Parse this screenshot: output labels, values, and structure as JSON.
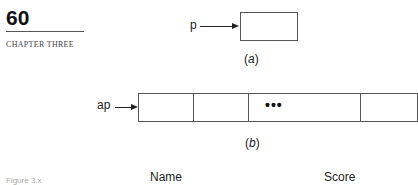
{
  "header": {
    "page_number": "60",
    "chapter": "CHAPTER THREE"
  },
  "figure_a": {
    "pointer_label": "p",
    "caption_open": "(",
    "caption_letter": "a",
    "caption_close": ")"
  },
  "figure_b": {
    "pointer_label": "ap",
    "ellipsis": "•••",
    "caption_open": "(",
    "caption_letter": "b",
    "caption_close": ")"
  },
  "table_header": {
    "col1": "Name",
    "col2": "Score"
  },
  "figure_label": "Figure 3.x"
}
